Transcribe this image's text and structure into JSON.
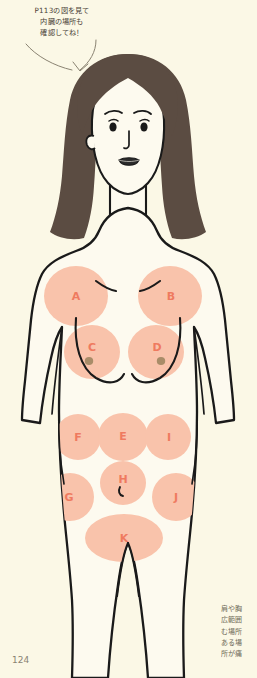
{
  "page": {
    "number": "124",
    "background_color": "#fbf8e6"
  },
  "callout": {
    "name": "instruction-callout",
    "lines": [
      "P113の図を見て",
      "内臓の場所も",
      "確認してね！"
    ]
  },
  "side_note": {
    "name": "margin-note",
    "lines": [
      "肩や胸",
      "広範囲",
      "む場所",
      "ある場",
      "所が痛"
    ]
  },
  "figure": {
    "name": "female-body-front-diagram",
    "colors": {
      "skin": "#fdfaef",
      "outline": "#1a1a1a",
      "hair": "#5b4c42",
      "zone_fill": "#f9c3ab",
      "zone_label": "#ef7a5f",
      "lip": "#2b2b2b",
      "nipple": "#8d7a52"
    }
  },
  "zones": [
    {
      "label": "A",
      "name": "zone-a-left-shoulder",
      "cx": 76,
      "cy": 296,
      "rx": 32,
      "ry": 30,
      "lx": 76,
      "ly": 296
    },
    {
      "label": "B",
      "name": "zone-b-right-shoulder",
      "cx": 170,
      "cy": 296,
      "rx": 32,
      "ry": 30,
      "lx": 171,
      "ly": 296
    },
    {
      "label": "C",
      "name": "zone-c-left-chest",
      "cx": 92,
      "cy": 352,
      "rx": 28,
      "ry": 27,
      "lx": 92,
      "ly": 347
    },
    {
      "label": "D",
      "name": "zone-d-right-chest",
      "cx": 156,
      "cy": 352,
      "rx": 28,
      "ry": 27,
      "lx": 157,
      "ly": 347
    },
    {
      "label": "F",
      "name": "zone-f-left-upper-abdomen",
      "cx": 78,
      "cy": 437,
      "rx": 23,
      "ry": 23,
      "lx": 78,
      "ly": 437
    },
    {
      "label": "E",
      "name": "zone-e-epigastrium",
      "cx": 123,
      "cy": 437,
      "rx": 25,
      "ry": 24,
      "lx": 123,
      "ly": 436
    },
    {
      "label": "I",
      "name": "zone-i-right-upper-abdomen",
      "cx": 168,
      "cy": 437,
      "rx": 23,
      "ry": 23,
      "lx": 169,
      "ly": 437
    },
    {
      "label": "H",
      "name": "zone-h-periumbilical",
      "cx": 123,
      "cy": 483,
      "rx": 23,
      "ry": 22,
      "lx": 123,
      "ly": 479
    },
    {
      "label": "G",
      "name": "zone-g-left-lower-abdomen",
      "cx": 70,
      "cy": 497,
      "rx": 24,
      "ry": 24,
      "lx": 69,
      "ly": 497
    },
    {
      "label": "J",
      "name": "zone-j-right-lower-abdomen",
      "cx": 176,
      "cy": 497,
      "rx": 24,
      "ry": 24,
      "lx": 176,
      "ly": 497
    },
    {
      "label": "K",
      "name": "zone-k-lower-abdomen",
      "cx": 124,
      "cy": 538,
      "rx": 39,
      "ry": 24,
      "lx": 124,
      "ly": 538
    }
  ]
}
